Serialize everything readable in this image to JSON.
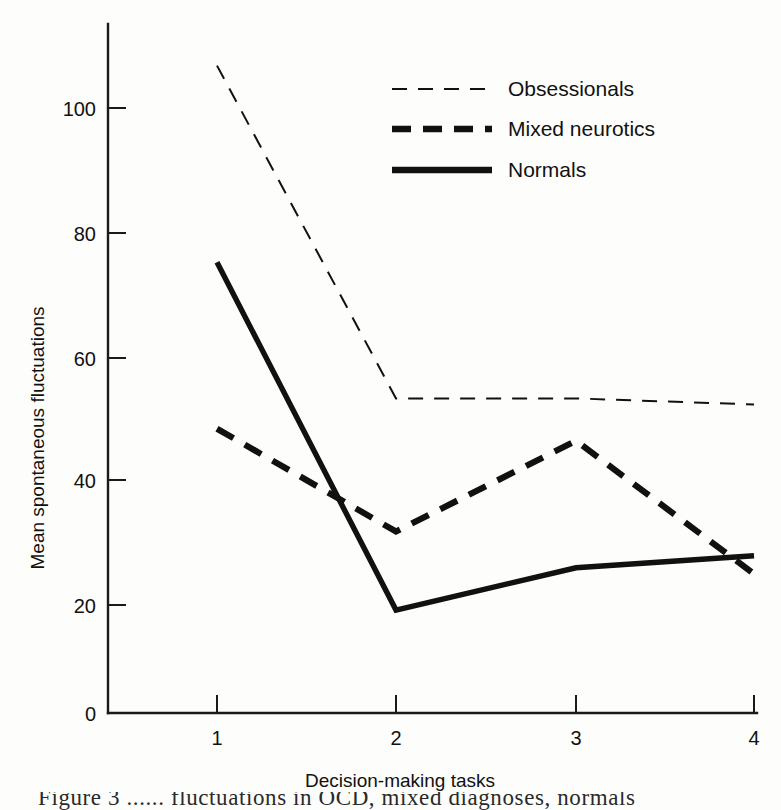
{
  "chart_data": {
    "type": "line",
    "title": "",
    "xlabel": "Decision-making tasks",
    "ylabel": "Mean spontaneous fluctuations",
    "x": [
      1,
      2,
      3,
      4
    ],
    "xtick_labels": [
      "1",
      "2",
      "3",
      "4"
    ],
    "ytick_labels": [
      "0",
      "20",
      "40",
      "60",
      "80",
      "100"
    ],
    "yticks": [
      0,
      20,
      40,
      60,
      80,
      100
    ],
    "xlim": [
      1,
      4
    ],
    "ylim": [
      0,
      108
    ],
    "grid": false,
    "legend_position": "upper-right",
    "series": [
      {
        "name": "Obsessionals",
        "style": "thin-dashed",
        "values": [
          107,
          52,
          52,
          51
        ]
      },
      {
        "name": "Mixed neurotics",
        "style": "thick-dashed",
        "values": [
          47,
          30,
          45,
          23
        ]
      },
      {
        "name": "Normals",
        "style": "thick-solid",
        "values": [
          74.5,
          17,
          24,
          26
        ]
      }
    ]
  },
  "legend": {
    "items": [
      {
        "label": "Obsessionals"
      },
      {
        "label": "Mixed neurotics"
      },
      {
        "label": "Normals"
      }
    ]
  },
  "axes": {
    "y_title": "Mean spontaneous fluctuations",
    "x_title": "Decision-making tasks",
    "y_ticks": [
      {
        "label": "100"
      },
      {
        "label": "80"
      },
      {
        "label": "60"
      },
      {
        "label": "40"
      },
      {
        "label": "20"
      },
      {
        "label": "0"
      }
    ],
    "x_ticks": [
      {
        "label": "1"
      },
      {
        "label": "2"
      },
      {
        "label": "3"
      },
      {
        "label": "4"
      }
    ]
  },
  "caption": {
    "text": "Figure 3    ......  fluctuations in OCD, mixed diagnoses, normals"
  },
  "colors": {
    "ink": "#111111",
    "page": "#fdfdfb"
  }
}
